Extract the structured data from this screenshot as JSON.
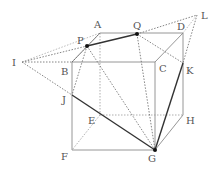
{
  "diagram": {
    "type": "cube-section-construction",
    "colors": {
      "edge": "#888888",
      "hidden": "#9a9a9a",
      "section": "#333333",
      "construction": "#555555",
      "point": "#111111"
    },
    "points": {
      "A": {
        "label": "A",
        "x": 100,
        "y": 33
      },
      "D": {
        "label": "D",
        "x": 183,
        "y": 33
      },
      "B": {
        "label": "B",
        "x": 72,
        "y": 62
      },
      "C": {
        "label": "C",
        "x": 155,
        "y": 62
      },
      "E": {
        "label": "E",
        "x": 100,
        "y": 115
      },
      "H": {
        "label": "H",
        "x": 183,
        "y": 115
      },
      "F": {
        "label": "F",
        "x": 72,
        "y": 150
      },
      "G": {
        "label": "G",
        "x": 155,
        "y": 150
      },
      "P": {
        "label": "P",
        "x": 87,
        "y": 46
      },
      "Q": {
        "label": "Q",
        "x": 137,
        "y": 34
      },
      "I": {
        "label": "I",
        "x": 22,
        "y": 62
      },
      "L": {
        "label": "L",
        "x": 197,
        "y": 15
      },
      "K": {
        "label": "K",
        "x": 183,
        "y": 63
      },
      "J": {
        "label": "J",
        "x": 72,
        "y": 95
      }
    },
    "labels": {
      "A": "A",
      "B": "B",
      "C": "C",
      "D": "D",
      "E": "E",
      "F": "F",
      "G": "G",
      "H": "H",
      "I": "I",
      "J": "J",
      "K": "K",
      "L": "L",
      "P": "P",
      "Q": "Q"
    }
  }
}
